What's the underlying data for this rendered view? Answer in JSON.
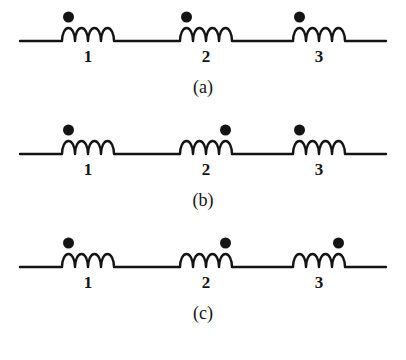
{
  "figure": {
    "background_color": "#ffffff",
    "ink_color": "#141414",
    "width": 406,
    "height": 360
  },
  "geometry": {
    "wire_start_x": 20,
    "wire_end_x": 386,
    "wire_y": 41,
    "coil_arc_count": 4,
    "coil_arc_width": 13,
    "coil_height": 13,
    "dot_radius": 5.5,
    "dot_center_y": 17,
    "label_y": 48,
    "caption_y": 78,
    "panel_tops": [
      0,
      113,
      226
    ],
    "coil_start_x": [
      62,
      180,
      293
    ],
    "coil_end_x": [
      114,
      232,
      345
    ]
  },
  "panels": [
    {
      "id": "panel-a",
      "caption": "(a)",
      "coils": [
        {
          "label": "1",
          "dot_side": "left"
        },
        {
          "label": "2",
          "dot_side": "left"
        },
        {
          "label": "3",
          "dot_side": "left"
        }
      ]
    },
    {
      "id": "panel-b",
      "caption": "(b)",
      "coils": [
        {
          "label": "1",
          "dot_side": "left"
        },
        {
          "label": "2",
          "dot_side": "right"
        },
        {
          "label": "3",
          "dot_side": "left"
        }
      ]
    },
    {
      "id": "panel-c",
      "caption": "(c)",
      "coils": [
        {
          "label": "1",
          "dot_side": "left"
        },
        {
          "label": "2",
          "dot_side": "right"
        },
        {
          "label": "3",
          "dot_side": "right"
        }
      ]
    }
  ]
}
